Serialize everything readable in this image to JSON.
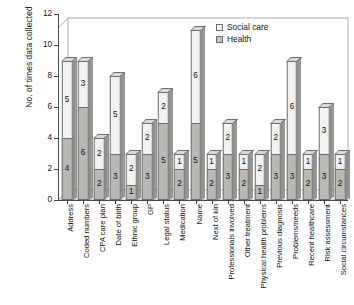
{
  "chart_data": {
    "type": "bar",
    "subtype": "stacked-3d-column",
    "title": "",
    "xlabel": "",
    "ylabel": "No. of times data collected",
    "ylim": [
      0,
      12
    ],
    "yticks": [
      0,
      2,
      4,
      6,
      8,
      10,
      12
    ],
    "grid": false,
    "legend_position": "top-right",
    "stacked": true,
    "categories": [
      "Address",
      "Coded numbers",
      "CPA care plan",
      "Date of birth",
      "Ethnic group",
      "GP",
      "Legal status",
      "Medication",
      "Name",
      "Next of kin",
      "Professionals involved",
      "Other treatment",
      "Physical health problems",
      "Previous diagnosis",
      "Problems/needs",
      "Recent healthcare",
      "Risk assessment",
      "Social circumstances"
    ],
    "series": [
      {
        "name": "Health",
        "color": "#b9b9b5",
        "values": [
          4,
          6,
          2,
          3,
          1,
          3,
          5,
          2,
          5,
          2,
          3,
          2,
          1,
          3,
          3,
          2,
          3,
          2
        ]
      },
      {
        "name": "Social care",
        "color": "#f1f1ef",
        "values": [
          5,
          3,
          2,
          5,
          2,
          2,
          2,
          1,
          6,
          1,
          2,
          1,
          2,
          2,
          6,
          1,
          3,
          1
        ]
      }
    ],
    "totals": [
      9,
      9,
      4,
      8,
      3,
      5,
      7,
      3,
      11,
      3,
      5,
      3,
      3,
      5,
      9,
      3,
      6,
      3
    ]
  },
  "legend": {
    "items": [
      {
        "label": "Social care",
        "key": "social"
      },
      {
        "label": "Health",
        "key": "health"
      }
    ]
  }
}
